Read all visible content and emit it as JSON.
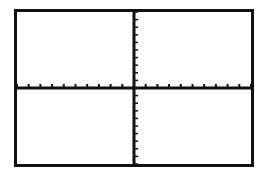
{
  "chart_data": {
    "type": "line",
    "title": "",
    "xlabel": "",
    "ylabel": "",
    "xlim": [
      -10,
      10
    ],
    "ylim": [
      -10,
      10
    ],
    "xscl": 1,
    "yscl": 1,
    "grid": false,
    "series": []
  },
  "screen": {
    "frame_color": "#111111",
    "axis_color": "#111111",
    "background": "#ffffff"
  }
}
